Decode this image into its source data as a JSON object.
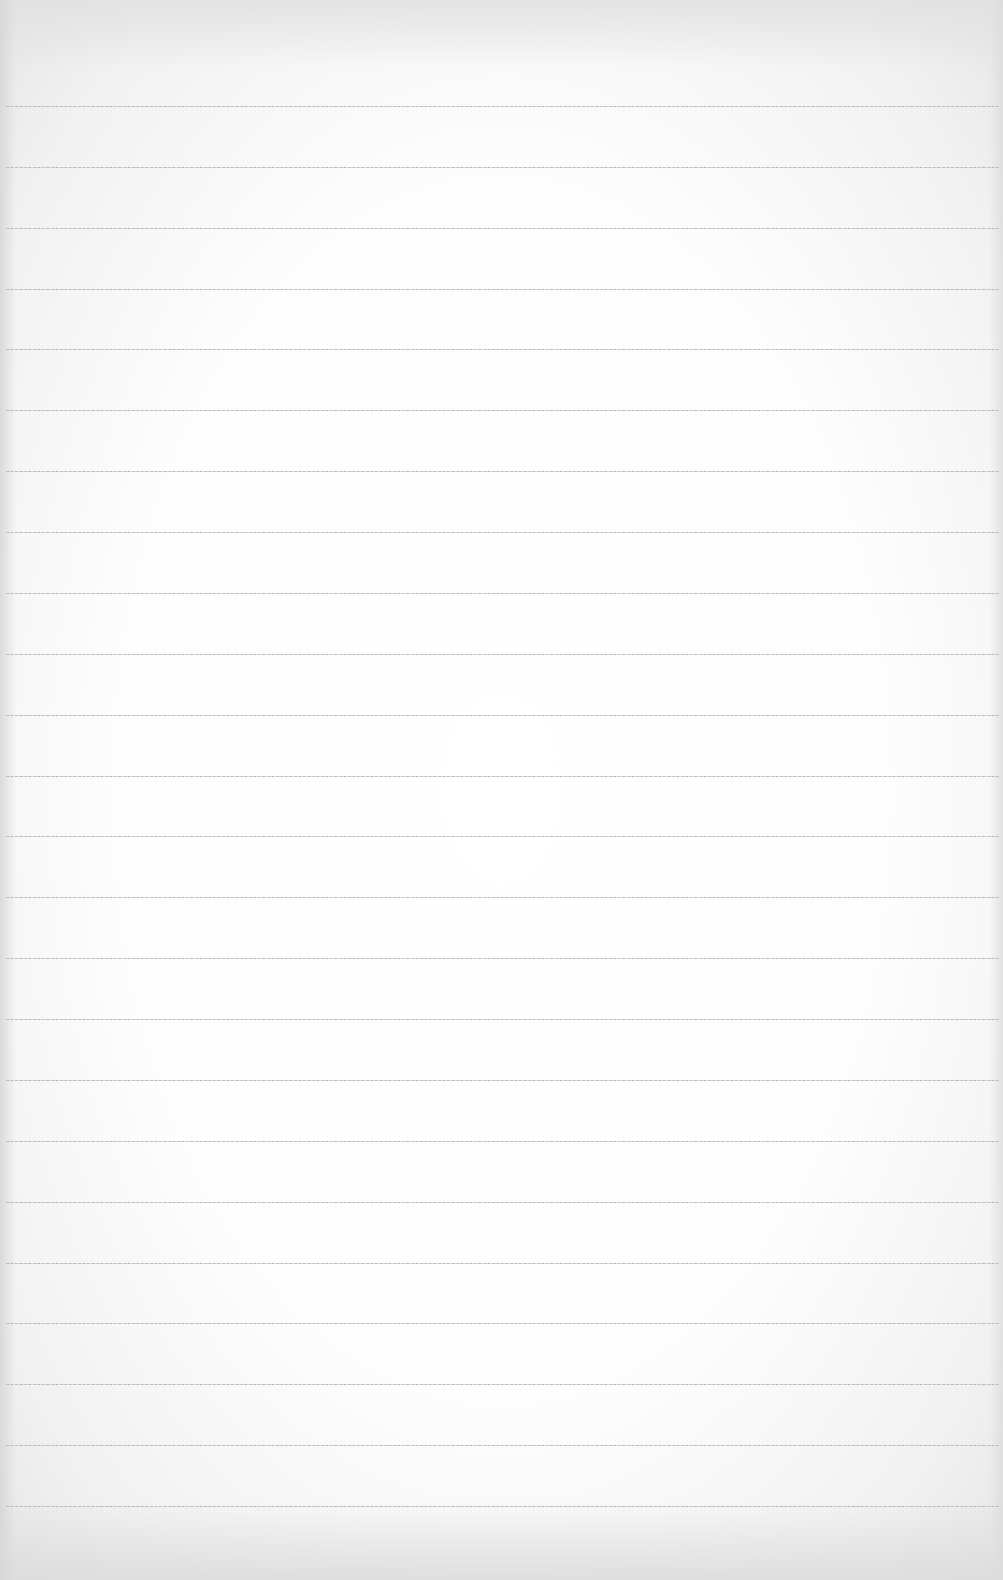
{
  "page": {
    "type": "blank ruled paper",
    "background_color": "#fcfcfc",
    "rule_color": "#b5b5b5",
    "rule_count": 24,
    "first_rule_y": 106,
    "rule_spacing": 60.87,
    "content": ""
  }
}
